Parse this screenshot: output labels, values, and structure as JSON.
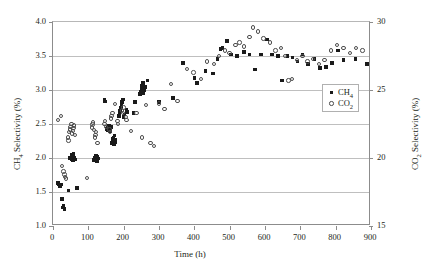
{
  "chart_data": {
    "type": "scatter",
    "title": "",
    "xlabel": "Time (h)",
    "ylabel": "CH4 Selectivity (%)",
    "ylabel_right": "CO2 Selectivity (%)",
    "xlim": [
      0,
      900
    ],
    "ylim": [
      1.0,
      4.0
    ],
    "ylim_right": [
      15,
      30
    ],
    "xticks": [
      0,
      100,
      200,
      300,
      400,
      500,
      600,
      700,
      800,
      900
    ],
    "yticks": [
      1.0,
      1.5,
      2.0,
      2.5,
      3.0,
      3.5,
      4.0
    ],
    "yticks_right": [
      15,
      20,
      25,
      30
    ],
    "xtick_labels": [
      "0",
      "100",
      "200",
      "300",
      "400",
      "500",
      "600",
      "700",
      "800",
      "900"
    ],
    "ytick_labels": [
      "1.0",
      "1.5",
      "2.0",
      "2.5",
      "3.0",
      "3.5",
      "4.0"
    ],
    "ytick_labels_right": [
      "15",
      "20",
      "25",
      "30"
    ],
    "grid": "horizontal",
    "legend_position": "inside-right-lower",
    "series": [
      {
        "name": "CH4",
        "axis": "left",
        "marker": "filled-square",
        "color": "#1a1a1a",
        "points": [
          [
            14,
            1.63
          ],
          [
            16,
            1.62
          ],
          [
            18,
            1.6
          ],
          [
            20,
            1.58
          ],
          [
            22,
            1.61
          ],
          [
            25,
            1.4
          ],
          [
            28,
            1.27
          ],
          [
            30,
            1.29
          ],
          [
            32,
            1.25
          ],
          [
            44,
            1.52
          ],
          [
            48,
            2.0
          ],
          [
            50,
            2.01
          ],
          [
            51,
            1.99
          ],
          [
            52,
            2.03
          ],
          [
            53,
            1.98
          ],
          [
            54,
            2.05
          ],
          [
            55,
            2.0
          ],
          [
            56,
            1.97
          ],
          [
            57,
            2.02
          ],
          [
            58,
            2.06
          ],
          [
            60,
            2.0
          ],
          [
            62,
            1.98
          ],
          [
            68,
            1.56
          ],
          [
            116,
            1.97
          ],
          [
            118,
            1.99
          ],
          [
            119,
            2.01
          ],
          [
            120,
            2.0
          ],
          [
            121,
            1.98
          ],
          [
            122,
            2.03
          ],
          [
            123,
            2.0
          ],
          [
            124,
            1.96
          ],
          [
            126,
            2.02
          ],
          [
            128,
            1.99
          ],
          [
            166,
            2.22
          ],
          [
            168,
            2.25
          ],
          [
            169,
            2.28
          ],
          [
            170,
            2.24
          ],
          [
            171,
            2.3
          ],
          [
            172,
            2.26
          ],
          [
            173,
            2.21
          ],
          [
            174,
            2.33
          ],
          [
            175,
            2.27
          ],
          [
            176,
            2.23
          ],
          [
            152,
            2.43
          ],
          [
            154,
            2.45
          ],
          [
            156,
            2.41
          ],
          [
            158,
            2.47
          ],
          [
            160,
            2.44
          ],
          [
            162,
            2.4
          ],
          [
            164,
            2.46
          ],
          [
            146,
            2.85
          ],
          [
            148,
            2.83
          ],
          [
            186,
            2.62
          ],
          [
            188,
            2.66
          ],
          [
            190,
            2.7
          ],
          [
            192,
            2.74
          ],
          [
            194,
            2.78
          ],
          [
            196,
            2.82
          ],
          [
            198,
            2.86
          ],
          [
            200,
            2.6
          ],
          [
            202,
            2.64
          ],
          [
            208,
            2.71
          ],
          [
            210,
            2.68
          ],
          [
            228,
            2.66
          ],
          [
            232,
            2.82
          ],
          [
            246,
            2.94
          ],
          [
            248,
            2.98
          ],
          [
            250,
            3.02
          ],
          [
            252,
            3.06
          ],
          [
            254,
            3.1
          ],
          [
            256,
            2.96
          ],
          [
            258,
            3.0
          ],
          [
            260,
            3.04
          ],
          [
            268,
            3.14
          ],
          [
            300,
            2.82
          ],
          [
            340,
            2.88
          ],
          [
            368,
            3.4
          ],
          [
            400,
            3.18
          ],
          [
            408,
            3.1
          ],
          [
            432,
            3.28
          ],
          [
            452,
            3.24
          ],
          [
            466,
            3.46
          ],
          [
            474,
            3.6
          ],
          [
            480,
            3.62
          ],
          [
            492,
            3.72
          ],
          [
            504,
            3.52
          ],
          [
            520,
            3.5
          ],
          [
            540,
            3.56
          ],
          [
            556,
            3.52
          ],
          [
            572,
            3.3
          ],
          [
            588,
            3.52
          ],
          [
            606,
            3.74
          ],
          [
            620,
            3.52
          ],
          [
            636,
            3.5
          ],
          [
            648,
            3.14
          ],
          [
            664,
            3.5
          ],
          [
            678,
            3.48
          ],
          [
            692,
            3.42
          ],
          [
            706,
            3.52
          ],
          [
            722,
            3.38
          ],
          [
            740,
            3.46
          ],
          [
            756,
            3.32
          ],
          [
            772,
            3.34
          ],
          [
            790,
            3.4
          ],
          [
            806,
            3.58
          ],
          [
            822,
            3.44
          ],
          [
            856,
            3.46
          ],
          [
            888,
            3.38
          ]
        ]
      },
      {
        "name": "CO2",
        "axis": "right",
        "marker": "open-circle",
        "color": "#4d4d4d",
        "points": [
          [
            14,
            2.56
          ],
          [
            22,
            2.62
          ],
          [
            26,
            1.88
          ],
          [
            30,
            1.8
          ],
          [
            32,
            1.76
          ],
          [
            34,
            1.72
          ],
          [
            36,
            1.7
          ],
          [
            46,
            2.38
          ],
          [
            48,
            2.42
          ],
          [
            50,
            2.46
          ],
          [
            52,
            2.5
          ],
          [
            54,
            2.36
          ],
          [
            56,
            2.4
          ],
          [
            58,
            2.44
          ],
          [
            60,
            2.48
          ],
          [
            62,
            2.34
          ],
          [
            44,
            2.26
          ],
          [
            42,
            2.3
          ],
          [
            96,
            1.71
          ],
          [
            110,
            2.45
          ],
          [
            112,
            2.49
          ],
          [
            114,
            2.52
          ],
          [
            116,
            2.41
          ],
          [
            118,
            2.3
          ],
          [
            120,
            2.34
          ],
          [
            122,
            2.38
          ],
          [
            126,
            2.22
          ],
          [
            146,
            2.5
          ],
          [
            148,
            2.54
          ],
          [
            150,
            2.46
          ],
          [
            160,
            2.42
          ],
          [
            162,
            2.38
          ],
          [
            164,
            2.58
          ],
          [
            166,
            2.62
          ],
          [
            168,
            2.66
          ],
          [
            176,
            2.79
          ],
          [
            182,
            2.54
          ],
          [
            184,
            2.5
          ],
          [
            196,
            2.7
          ],
          [
            198,
            2.66
          ],
          [
            200,
            2.74
          ],
          [
            206,
            2.6
          ],
          [
            208,
            2.56
          ],
          [
            220,
            2.4
          ],
          [
            236,
            2.66
          ],
          [
            252,
            2.3
          ],
          [
            264,
            2.78
          ],
          [
            276,
            2.22
          ],
          [
            286,
            2.18
          ],
          [
            300,
            2.8
          ],
          [
            316,
            2.72
          ],
          [
            334,
            3.09
          ],
          [
            352,
            2.84
          ],
          [
            380,
            3.31
          ],
          [
            398,
            3.26
          ],
          [
            418,
            3.16
          ],
          [
            436,
            3.42
          ],
          [
            456,
            3.38
          ],
          [
            470,
            3.5
          ],
          [
            486,
            3.58
          ],
          [
            500,
            3.54
          ],
          [
            516,
            3.66
          ],
          [
            528,
            3.7
          ],
          [
            540,
            3.64
          ],
          [
            556,
            3.78
          ],
          [
            566,
            3.92
          ],
          [
            580,
            3.86
          ],
          [
            596,
            3.76
          ],
          [
            614,
            3.7
          ],
          [
            630,
            3.58
          ],
          [
            646,
            3.62
          ],
          [
            656,
            3.5
          ],
          [
            666,
            3.14
          ],
          [
            676,
            3.16
          ],
          [
            690,
            3.44
          ],
          [
            706,
            3.5
          ],
          [
            720,
            3.42
          ],
          [
            736,
            3.46
          ],
          [
            752,
            3.38
          ],
          [
            768,
            3.44
          ],
          [
            786,
            3.58
          ],
          [
            804,
            3.66
          ],
          [
            822,
            3.62
          ],
          [
            840,
            3.54
          ],
          [
            858,
            3.62
          ],
          [
            876,
            3.58
          ]
        ]
      }
    ]
  },
  "legend": {
    "entries": [
      {
        "label_main": "CH",
        "label_sub": "4",
        "marker": "filled-square"
      },
      {
        "label_main": "CO",
        "label_sub": "2",
        "marker": "open-circle"
      }
    ]
  },
  "axis_titles": {
    "x": "Time (h)",
    "y_left_main_a": "CH",
    "y_left_sub": "4",
    "y_left_main_b": " Selectivity (%)",
    "y_right_main_a": "CO",
    "y_right_sub": "2",
    "y_right_main_b": " Selectivity (%)"
  }
}
